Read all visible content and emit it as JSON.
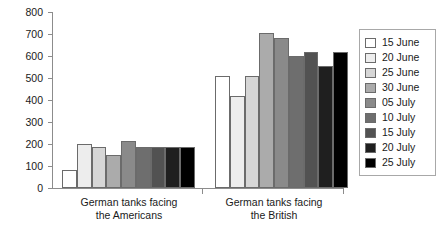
{
  "chart_data": {
    "type": "bar",
    "title": "",
    "subtitle": "",
    "xlabel": "",
    "ylabel": "",
    "ylim": [
      0,
      800
    ],
    "ytick_step": 100,
    "yticks": [
      0,
      100,
      200,
      300,
      400,
      500,
      600,
      700,
      800
    ],
    "ytick_labels": [
      "0",
      "100",
      "200",
      "300",
      "400",
      "500",
      "600",
      "700",
      "800"
    ],
    "grid": false,
    "legend_position": "right",
    "categories": [
      "German tanks facing the Americans",
      "German tanks facing the British"
    ],
    "category_lines": [
      [
        "German tanks facing",
        "the Americans"
      ],
      [
        "German tanks facing",
        "the British"
      ]
    ],
    "series": [
      {
        "name": "15 June",
        "color": "#ffffff",
        "values": [
          80,
          510
        ]
      },
      {
        "name": "20 June",
        "color": "#ededed",
        "values": [
          200,
          420
        ]
      },
      {
        "name": "25 June",
        "color": "#d6d6d6",
        "values": [
          185,
          510
        ]
      },
      {
        "name": "30 June",
        "color": "#ababab",
        "values": [
          150,
          705
        ]
      },
      {
        "name": "05 July",
        "color": "#8a8a8a",
        "values": [
          215,
          680
        ]
      },
      {
        "name": "10 July",
        "color": "#6e6e6e",
        "values": [
          185,
          598
        ]
      },
      {
        "name": "15 July",
        "color": "#525252",
        "values": [
          185,
          618
        ]
      },
      {
        "name": "20 July",
        "color": "#1f1f1f",
        "values": [
          185,
          555
        ]
      },
      {
        "name": "25 July",
        "color": "#000000",
        "values": [
          185,
          620
        ]
      }
    ]
  }
}
